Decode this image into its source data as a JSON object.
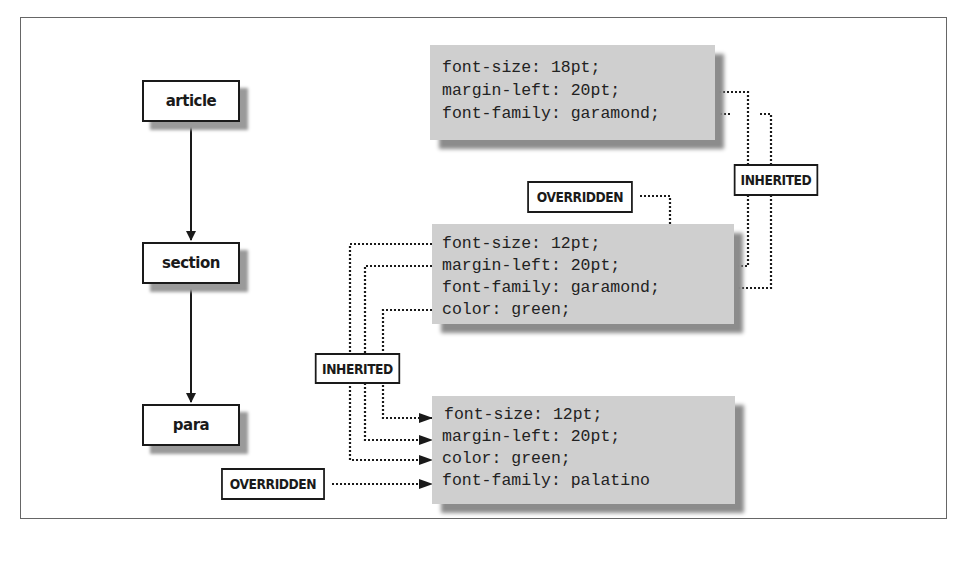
{
  "diagram": {
    "title": "",
    "tree_nodes": [
      {
        "id": "article",
        "label": "article"
      },
      {
        "id": "section",
        "label": "section"
      },
      {
        "id": "para",
        "label": "para"
      }
    ],
    "tree_edges": [
      {
        "from": "article",
        "to": "section"
      },
      {
        "from": "section",
        "to": "para"
      }
    ],
    "style_blocks": {
      "article": {
        "lines": [
          "font-size: 18pt;",
          "margin-left: 20pt;",
          "font-family: garamond;"
        ]
      },
      "section": {
        "lines": [
          "font-size: 12pt;",
          "margin-left: 20pt;",
          "font-family: garamond;",
          "color: green;"
        ]
      },
      "para": {
        "lines": [
          "font-size: 12pt;",
          "margin-left: 20pt;",
          "color: green;",
          "font-family: palatino"
        ]
      }
    },
    "annotations": {
      "overridden_top": "OVERRIDDEN",
      "inherited_right": "INHERITED",
      "inherited_left": "INHERITED",
      "overridden_bottom": "OVERRIDDEN"
    },
    "relations": [
      {
        "from": "article.margin-left",
        "to": "section.margin-left",
        "type": "INHERITED"
      },
      {
        "from": "article.font-family",
        "to": "section.font-family",
        "type": "INHERITED"
      },
      {
        "from": "OVERRIDDEN",
        "to": "section.font-size",
        "type": "OVERRIDDEN"
      },
      {
        "from": "section.font-size",
        "to": "para.font-size",
        "type": "INHERITED"
      },
      {
        "from": "section.margin-left",
        "to": "para.margin-left",
        "type": "INHERITED"
      },
      {
        "from": "section.color",
        "to": "para.color",
        "type": "INHERITED"
      },
      {
        "from": "OVERRIDDEN",
        "to": "para.font-family",
        "type": "OVERRIDDEN"
      }
    ],
    "colors": {
      "code_background": "#cfcfcf",
      "shadow": "#8c8c8c",
      "border": "#1a1a1a",
      "frame": "#666666"
    }
  }
}
